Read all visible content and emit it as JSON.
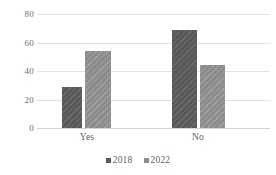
{
  "chart_data": {
    "type": "bar",
    "title": "",
    "subtitle": "",
    "xlabel": "",
    "ylabel": "",
    "categories": [
      "Yes",
      "No"
    ],
    "series": [
      {
        "name": "2018",
        "color": "#595959",
        "values": [
          29,
          69
        ]
      },
      {
        "name": "2022",
        "color": "#8d8d8d",
        "values": [
          54,
          44
        ]
      }
    ],
    "ylim": [
      0,
      80
    ],
    "yticks": [
      0,
      20,
      40,
      60,
      80
    ],
    "ytick_labels": [
      "0",
      "20",
      "40",
      "60",
      "80"
    ],
    "grid": true,
    "grid_axis": "y",
    "legend": {
      "position": "bottom",
      "entries": [
        {
          "label": "2018",
          "marker": "square",
          "color": "#595959"
        },
        {
          "label": "2022",
          "marker": "square",
          "color": "#8d8d8d"
        }
      ]
    },
    "bar_pattern": "diagonal-hatch",
    "colors": {
      "series_2018": "#595959",
      "series_2022": "#8d8d8d",
      "gridline": "#e2e2e2",
      "axis_text": "#5f5f5f",
      "background": "#ffffff"
    }
  }
}
